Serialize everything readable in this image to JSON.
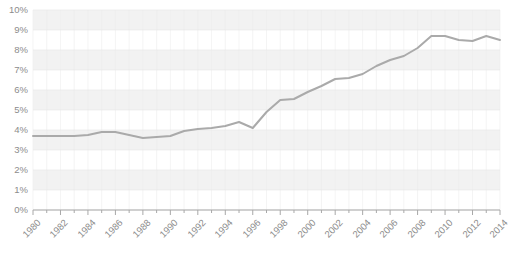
{
  "chart_data": {
    "type": "line",
    "title": "",
    "subtitle": "",
    "xlabel": "",
    "ylabel": "",
    "xlim": [
      1980,
      2014
    ],
    "ylim": [
      0,
      10
    ],
    "ytick_values": [
      0,
      1,
      2,
      3,
      4,
      5,
      6,
      7,
      8,
      9,
      10
    ],
    "ytick_labels": [
      "0%",
      "1%",
      "2%",
      "3%",
      "4%",
      "5%",
      "6%",
      "7%",
      "8%",
      "9%",
      "10%"
    ],
    "xtick_labels": [
      "1980",
      "1982",
      "1984",
      "1986",
      "1988",
      "1990",
      "1992",
      "1994",
      "1996",
      "1998",
      "2000",
      "2002",
      "2004",
      "2006",
      "2008",
      "2010",
      "2012",
      "2014"
    ],
    "xtick_step": 2,
    "minor_xticks_every": 1,
    "grid": true,
    "grid_style": "alternating-horizontal-bands",
    "legend": false,
    "legend_position": "none",
    "line_color": "#aaaaaa",
    "band_color": "#f2f2f2",
    "axis_color": "#a8a8a8",
    "tick_label_color": "#8c8c8c",
    "series": [
      {
        "name": "value",
        "x": [
          1980,
          1981,
          1982,
          1983,
          1984,
          1985,
          1986,
          1987,
          1988,
          1989,
          1990,
          1991,
          1992,
          1993,
          1994,
          1995,
          1996,
          1997,
          1998,
          1999,
          2000,
          2001,
          2002,
          2003,
          2004,
          2005,
          2006,
          2007,
          2008,
          2009,
          2010,
          2011,
          2012,
          2013,
          2014
        ],
        "values": [
          3.7,
          3.7,
          3.7,
          3.7,
          3.75,
          3.9,
          3.9,
          3.75,
          3.6,
          3.65,
          3.7,
          3.95,
          4.05,
          4.1,
          4.2,
          4.4,
          4.1,
          4.9,
          5.5,
          5.55,
          5.9,
          6.2,
          6.55,
          6.6,
          6.8,
          7.2,
          7.5,
          7.7,
          8.1,
          8.7,
          8.7,
          8.5,
          8.45,
          8.7,
          8.5
        ]
      }
    ]
  }
}
